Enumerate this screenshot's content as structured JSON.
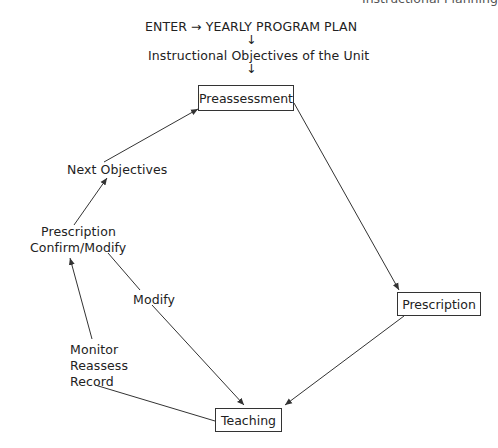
{
  "running_header": "Instructional Planning",
  "flow_top": {
    "enter_line": "ENTER → YEARLY PROGRAM PLAN",
    "arrow1": "↓",
    "objectives": "Instructional Objectives of the Unit",
    "arrow2": "↓"
  },
  "boxes": {
    "preassessment": "Preassessment",
    "prescription": "Prescription",
    "teaching": "Teaching"
  },
  "labels": {
    "next_objectives": "Next Objectives",
    "prescription_line1": "Prescription",
    "prescription_line2": "Confirm/Modify",
    "modify": "Modify",
    "monitor": "Monitor",
    "reassess": "Reassess",
    "record": "Record"
  },
  "colors": {
    "line": "#333333",
    "text": "#222222"
  }
}
